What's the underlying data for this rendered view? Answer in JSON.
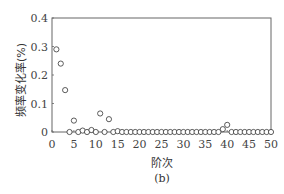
{
  "chart_data": {
    "type": "scatter",
    "title": "",
    "caption": "(b)",
    "xlabel": "阶次",
    "ylabel": "频率变化率(%)",
    "xlim": [
      0,
      50
    ],
    "ylim": [
      0,
      0.4
    ],
    "xticks": [
      0,
      5,
      10,
      15,
      20,
      25,
      30,
      35,
      40,
      45,
      50
    ],
    "yticks": [
      0,
      0.1,
      0.2,
      0.3,
      0.4
    ],
    "ytick_labels": [
      "0",
      "0.1",
      "0.2",
      "0.3",
      "0.4"
    ],
    "grid": false,
    "marker": "open-circle",
    "x": [
      1,
      2,
      3,
      4,
      5,
      6,
      7,
      8,
      9,
      10,
      11,
      12,
      13,
      14,
      15,
      16,
      17,
      18,
      19,
      20,
      21,
      22,
      23,
      24,
      25,
      26,
      27,
      28,
      29,
      30,
      31,
      32,
      33,
      34,
      35,
      36,
      37,
      38,
      39,
      40,
      41,
      42,
      43,
      44,
      45,
      46,
      47,
      48,
      49,
      50
    ],
    "values": [
      0.29,
      0.24,
      0.147,
      0,
      0.04,
      0,
      0.005,
      0,
      0.007,
      0,
      0.065,
      0,
      0.045,
      0,
      0.003,
      0,
      0,
      0,
      0,
      0,
      0,
      0,
      0,
      0,
      0,
      0,
      0,
      0,
      0,
      0,
      0,
      0,
      0,
      0,
      0,
      0,
      0,
      0,
      0.01,
      0.025,
      0,
      0,
      0,
      0,
      0,
      0,
      0,
      0,
      0,
      0
    ]
  },
  "labels": {
    "xlabel": "阶次",
    "ylabel": "频率变化率(%)",
    "caption": "(b)"
  }
}
